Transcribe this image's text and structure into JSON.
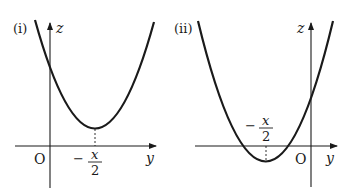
{
  "figure": {
    "panels": [
      {
        "id": "i",
        "label": "(i)",
        "vertical_axis_label": "z",
        "horizontal_axis_label": "y",
        "origin_label": "O",
        "vertex_label": {
          "minus": "−",
          "numerator": "x",
          "denominator": "2"
        },
        "description": "Upward parabola with vertex at y = -x/2, positioned to the right of the origin, entirely above the y-axis (no real roots)"
      },
      {
        "id": "ii",
        "label": "(ii)",
        "vertical_axis_label": "z",
        "horizontal_axis_label": "y",
        "origin_label": "O",
        "vertex_label": {
          "minus": "−",
          "numerator": "x",
          "denominator": "2"
        },
        "description": "Upward parabola with vertex at y = -x/2, positioned to the left of the origin, dipping below the y-axis (two negative real roots)"
      }
    ],
    "colors": {
      "curve": "#1a1a1a",
      "axis": "#1a1a1a",
      "background": "#ffffff"
    }
  }
}
